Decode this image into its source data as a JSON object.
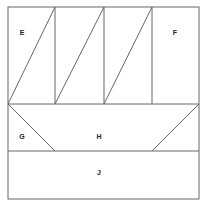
{
  "diagram": {
    "stroke_color": "#666666",
    "labels": {
      "E": "E",
      "F": "F",
      "G": "G",
      "H": "H",
      "J": "J"
    }
  }
}
